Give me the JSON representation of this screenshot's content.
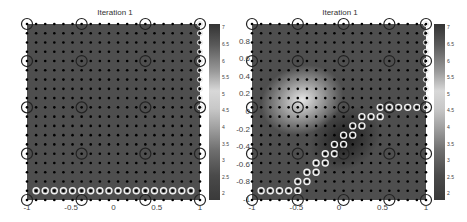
{
  "chart_data": [
    {
      "type": "heatmap",
      "title": "Iteration 1",
      "xlabel": "",
      "ylabel": "",
      "xlim": [
        -1,
        1
      ],
      "ylim": [
        -1,
        1
      ],
      "x_ticks": [
        "-1",
        "-0.5",
        "0",
        "0.5",
        "1"
      ],
      "y_ticks": [
        "-1",
        "-0.8",
        "-0.6",
        "-0.4",
        "-0.2",
        "0",
        "0.2",
        "0.4",
        "0.6",
        "0.8"
      ],
      "colorbar_ticks": [
        "7",
        "6.5",
        "6",
        "5.5",
        "5",
        "4.5",
        "4",
        "3.5",
        "3",
        "2.5",
        "2"
      ],
      "colorbar_range": [
        1.8,
        7.1
      ],
      "field": "uniform value about 6.6 (dark gray)",
      "grid_points": "20 x 20 regular grid of black dots on [-1,1]^2",
      "large_circles_xy_index": [
        [
          0,
          0
        ],
        [
          6,
          0
        ],
        [
          13,
          0
        ],
        [
          19,
          0
        ],
        [
          0,
          4
        ],
        [
          6,
          4
        ],
        [
          13,
          4
        ],
        [
          19,
          4
        ],
        [
          0,
          9
        ],
        [
          6,
          9
        ],
        [
          13,
          9
        ],
        [
          19,
          9
        ],
        [
          0,
          14
        ],
        [
          6,
          14
        ],
        [
          13,
          14
        ],
        [
          19,
          14
        ],
        [
          0,
          19
        ],
        [
          6,
          19
        ],
        [
          13,
          19
        ],
        [
          19,
          19
        ]
      ],
      "white_circles_xy_index": [
        [
          1,
          18
        ],
        [
          2,
          18
        ],
        [
          3,
          18
        ],
        [
          4,
          18
        ],
        [
          5,
          18
        ],
        [
          6,
          18
        ],
        [
          7,
          18
        ],
        [
          8,
          18
        ],
        [
          9,
          18
        ],
        [
          10,
          18
        ],
        [
          11,
          18
        ],
        [
          12,
          18
        ],
        [
          13,
          18
        ],
        [
          14,
          18
        ],
        [
          15,
          18
        ],
        [
          16,
          18
        ],
        [
          17,
          18
        ],
        [
          18,
          18
        ]
      ]
    },
    {
      "type": "heatmap",
      "title": "Iteration 1",
      "xlabel": "",
      "ylabel": "",
      "xlim": [
        -1,
        1
      ],
      "ylim": [
        -1,
        1
      ],
      "x_ticks": [
        "-1",
        "-0.5",
        "0",
        "0.5",
        "1"
      ],
      "y_ticks": [
        "-1",
        "-0.8",
        "-0.6",
        "-0.4",
        "-0.2",
        "0",
        "0.2",
        "0.4",
        "0.6",
        "0.8"
      ],
      "colorbar_ticks": [
        "7",
        "6.5",
        "6",
        "5.5",
        "5",
        "4.5",
        "4",
        "3.5",
        "3",
        "2.5",
        "2"
      ],
      "colorbar_range": [
        1.8,
        7.1
      ],
      "field": "background about 6.6; bright peak (~5) near (-0.5, 0.1); dark trough (~2) near (0.05, -0.35)",
      "grid_points": "20 x 20 regular grid of black dots on [-1,1]^2",
      "large_circles_xy_index": [
        [
          0,
          0
        ],
        [
          5,
          0
        ],
        [
          10,
          0
        ],
        [
          15,
          0
        ],
        [
          19,
          0
        ],
        [
          0,
          4
        ],
        [
          5,
          4
        ],
        [
          10,
          4
        ],
        [
          15,
          4
        ],
        [
          19,
          4
        ],
        [
          0,
          9
        ],
        [
          5,
          9
        ],
        [
          10,
          9
        ],
        [
          15,
          9
        ],
        [
          19,
          9
        ],
        [
          0,
          14
        ],
        [
          5,
          14
        ],
        [
          10,
          14
        ],
        [
          15,
          14
        ],
        [
          19,
          14
        ],
        [
          0,
          19
        ],
        [
          5,
          19
        ],
        [
          10,
          19
        ],
        [
          15,
          19
        ],
        [
          19,
          19
        ]
      ],
      "white_circles_xy_index": [
        [
          14,
          9
        ],
        [
          15,
          9
        ],
        [
          16,
          9
        ],
        [
          17,
          9
        ],
        [
          18,
          9
        ],
        [
          12,
          10
        ],
        [
          13,
          10
        ],
        [
          14,
          10
        ],
        [
          11,
          11
        ],
        [
          12,
          11
        ],
        [
          10,
          12
        ],
        [
          11,
          12
        ],
        [
          9,
          13
        ],
        [
          10,
          13
        ],
        [
          8,
          14
        ],
        [
          9,
          14
        ],
        [
          7,
          15
        ],
        [
          8,
          15
        ],
        [
          6,
          16
        ],
        [
          7,
          16
        ],
        [
          5,
          17
        ],
        [
          6,
          17
        ],
        [
          1,
          18
        ],
        [
          2,
          18
        ],
        [
          3,
          18
        ],
        [
          4,
          18
        ],
        [
          5,
          18
        ]
      ]
    }
  ],
  "panels": [
    {
      "title": "Iteration 1"
    },
    {
      "title": "Iteration 1"
    }
  ],
  "axes": {
    "y_ticks": [
      "0.8",
      "0.6",
      "0.4",
      "0.2",
      "0",
      "-0.2",
      "-0.4",
      "-0.6",
      "-0.8",
      "-1"
    ],
    "x_ticks": [
      "-1",
      "-0.5",
      "0",
      "0.5",
      "1"
    ],
    "colorbar_ticks": [
      "7",
      "6.5",
      "6",
      "5.5",
      "5",
      "4.5",
      "4",
      "3.5",
      "3",
      "2.5",
      "2"
    ]
  }
}
